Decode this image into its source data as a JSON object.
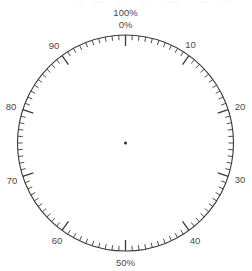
{
  "diagram": {
    "kind": "percentage-dial-scale",
    "title_top_outer": "100%",
    "title_top_inner": "0%",
    "title_bottom": "50%",
    "center_marker": "center-dot",
    "geometry": {
      "center_x": 125.5,
      "center_y": 143,
      "radius": 108,
      "units_per_turn": 100,
      "minor_tick_step": 1,
      "major_tick_step": 10,
      "minor_tick_len": 5,
      "major_tick_len": 11,
      "start_angle_deg": -90,
      "direction": "clockwise"
    },
    "colors": {
      "ring": "#3a3a3a",
      "tick": "#3a3a3a",
      "label": "#4a4a4a",
      "center": "#2b2b2b",
      "background": "#ffffff"
    },
    "labels": [
      {
        "text": "0%",
        "value": 0,
        "placement": "outside-top-inner",
        "x": 125.5,
        "y": 25.5
      },
      {
        "text": "100%",
        "value": 100,
        "placement": "outside-top-outer",
        "x": 125.5,
        "y": 13.5
      },
      {
        "text": "10",
        "value": 10,
        "placement": "inside",
        "x": 190.5,
        "y": 45.5
      },
      {
        "text": "20",
        "value": 20,
        "placement": "outside",
        "x": 240.0,
        "y": 107.0
      },
      {
        "text": "30",
        "value": 30,
        "placement": "outside",
        "x": 240.0,
        "y": 180.0
      },
      {
        "text": "40",
        "value": 40,
        "placement": "inside",
        "x": 195.0,
        "y": 241.0
      },
      {
        "text": "50%",
        "value": 50,
        "placement": "outside-bottom",
        "x": 125.5,
        "y": 263.0
      },
      {
        "text": "60",
        "value": 60,
        "placement": "inside",
        "x": 57.0,
        "y": 241.0
      },
      {
        "text": "70",
        "value": 70,
        "placement": "outside",
        "x": 12.0,
        "y": 181.0
      },
      {
        "text": "80",
        "value": 80,
        "placement": "outside",
        "x": 11.0,
        "y": 107.0
      },
      {
        "text": "90",
        "value": 90,
        "placement": "inside",
        "x": 54.0,
        "y": 46.0
      }
    ]
  }
}
